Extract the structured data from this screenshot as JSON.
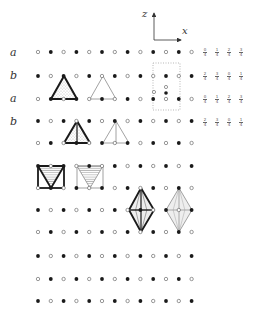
{
  "axes": {
    "origin": [
      154,
      40
    ],
    "z_label": "z",
    "x_label": "x",
    "z_end": [
      154,
      13
    ],
    "x_end": [
      181,
      40
    ]
  },
  "row_labels": [
    {
      "text": "a",
      "x": 10,
      "y": 47
    },
    {
      "text": "b",
      "x": 10,
      "y": 70
    },
    {
      "text": "a",
      "x": 10,
      "y": 93
    },
    {
      "text": "b",
      "x": 10,
      "y": 116
    }
  ],
  "grid": {
    "x0": 38,
    "dx": 12.8,
    "columns": 13,
    "rows": [
      {
        "y": 52,
        "start": "open"
      },
      {
        "y": 76,
        "start": "filled"
      },
      {
        "y": 99,
        "start": "open"
      },
      {
        "y": 121,
        "start": "filled"
      },
      {
        "y": 143,
        "start": "open"
      },
      {
        "y": 166,
        "start": "filled"
      },
      {
        "y": 188,
        "start": "open"
      },
      {
        "y": 210,
        "start": "filled"
      },
      {
        "y": 232,
        "start": "open"
      },
      {
        "y": 256,
        "start": "filled"
      },
      {
        "y": 279,
        "start": "open"
      },
      {
        "y": 301,
        "start": "filled"
      }
    ]
  },
  "extra_dots": [
    {
      "x": 154,
      "y": 92,
      "type": "open"
    },
    {
      "x": 166,
      "y": 87,
      "type": "open"
    },
    {
      "x": 166,
      "y": 93,
      "type": "filled"
    }
  ],
  "unit_cell": {
    "x": 153,
    "y": 63,
    "w": 27,
    "h": 47
  },
  "fraction_labels": {
    "columns_x": [
      205,
      217,
      229,
      241
    ],
    "rows": [
      {
        "y": 48,
        "values": [
          [
            "0",
            "4"
          ],
          [
            "1",
            "4"
          ],
          [
            "2",
            "4"
          ],
          [
            "3",
            "4"
          ]
        ]
      },
      {
        "y": 72,
        "values": [
          [
            "2",
            "4"
          ],
          [
            "3",
            "4"
          ],
          [
            "0",
            "4"
          ],
          [
            "1",
            "4"
          ]
        ]
      },
      {
        "y": 95,
        "values": [
          [
            "0",
            "4"
          ],
          [
            "1",
            "4"
          ],
          [
            "2",
            "4"
          ],
          [
            "3",
            "4"
          ]
        ]
      },
      {
        "y": 118,
        "values": [
          [
            "2",
            "4"
          ],
          [
            "3",
            "4"
          ],
          [
            "0",
            "4"
          ],
          [
            "1",
            "4"
          ]
        ]
      }
    ]
  },
  "shapes": {
    "triangle_a": {
      "points": [
        [
          64,
          76
        ],
        [
          51,
          99
        ],
        [
          77,
          99
        ]
      ],
      "style": "bold-stippled"
    },
    "triangle_b": {
      "points": [
        [
          103,
          76
        ],
        [
          90,
          99
        ],
        [
          116,
          99
        ]
      ],
      "style": "thin"
    },
    "triangle_c": {
      "points": [
        [
          77,
          121
        ],
        [
          64,
          143
        ],
        [
          90,
          143
        ]
      ],
      "style": "bold-stippled",
      "center_line": true
    },
    "triangle_d": {
      "points": [
        [
          116,
          121
        ],
        [
          103,
          143
        ],
        [
          129,
          143
        ]
      ],
      "style": "thin",
      "center_line": true
    },
    "square_a": {
      "x": 38,
      "y": 166,
      "w": 26,
      "h": 22,
      "style": "bold-hatched"
    },
    "square_b": {
      "x": 77,
      "y": 166,
      "w": 26,
      "h": 22,
      "style": "thin-hatched"
    },
    "diamond_a": {
      "cx": 141,
      "top": 188,
      "bottom": 232,
      "left": 129,
      "right": 154,
      "mid": 210,
      "style": "bold"
    },
    "diamond_b": {
      "cx": 179,
      "top": 188,
      "bottom": 232,
      "left": 166,
      "right": 192,
      "mid": 210,
      "style": "thin"
    }
  },
  "colors": {
    "ink": "#1a1a1a",
    "gray": "#8a8a8a",
    "stipple": "#bdbdbd",
    "dotted": "#999999"
  }
}
